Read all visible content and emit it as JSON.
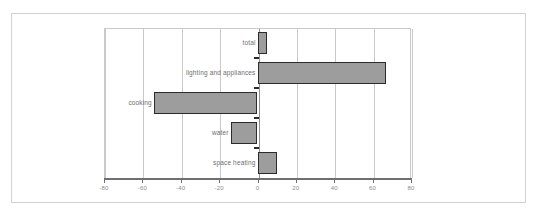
{
  "chart_data": {
    "type": "bar",
    "orientation": "horizontal",
    "title": "",
    "subtitle": "",
    "xlabel": "",
    "ylabel": "",
    "xlim": [
      -80,
      80
    ],
    "grid": true,
    "legend": "none",
    "categories": [
      "total",
      "lighting and appliances",
      "cooking",
      "water",
      "space heating"
    ],
    "values": [
      5,
      67,
      -54,
      -14,
      10
    ],
    "xticks": [
      -80,
      -60,
      -40,
      -20,
      0,
      20,
      40,
      60,
      80
    ],
    "xticklabels": [
      "-80",
      "-60",
      "-40",
      "-20",
      "0",
      "20",
      "40",
      "60",
      "80"
    ],
    "series": [
      {
        "name": "change",
        "values": [
          5,
          67,
          -54,
          -14,
          10
        ]
      }
    ],
    "bar_color": "#9d9d9d",
    "bar_edge_color": "#2b2b2b",
    "grid_color": "#c9c9c9",
    "axis_color": "#6f6f6f",
    "label_color": "#6e6e6e"
  },
  "figure": {
    "caption": ""
  }
}
